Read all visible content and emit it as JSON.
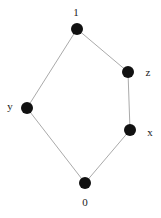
{
  "diagram": {
    "type": "hasse-diagram",
    "nodes": [
      {
        "id": "1",
        "label": "1",
        "x": 77,
        "y": 29,
        "lx": 76,
        "ly": 16
      },
      {
        "id": "z",
        "label": "z",
        "x": 128,
        "y": 72,
        "lx": 148,
        "ly": 76
      },
      {
        "id": "y",
        "label": "y",
        "x": 27,
        "y": 108,
        "lx": 10,
        "ly": 110
      },
      {
        "id": "x",
        "label": "x",
        "x": 130,
        "y": 130,
        "lx": 150,
        "ly": 136
      },
      {
        "id": "0",
        "label": "0",
        "x": 85,
        "y": 183,
        "lx": 85,
        "ly": 206
      }
    ],
    "edges": [
      [
        "1",
        "z"
      ],
      [
        "1",
        "y"
      ],
      [
        "z",
        "x"
      ],
      [
        "y",
        "0"
      ],
      [
        "x",
        "0"
      ]
    ],
    "colors": {
      "node": "#111111",
      "edge": "#aaaaaa",
      "label": "#222222"
    }
  }
}
